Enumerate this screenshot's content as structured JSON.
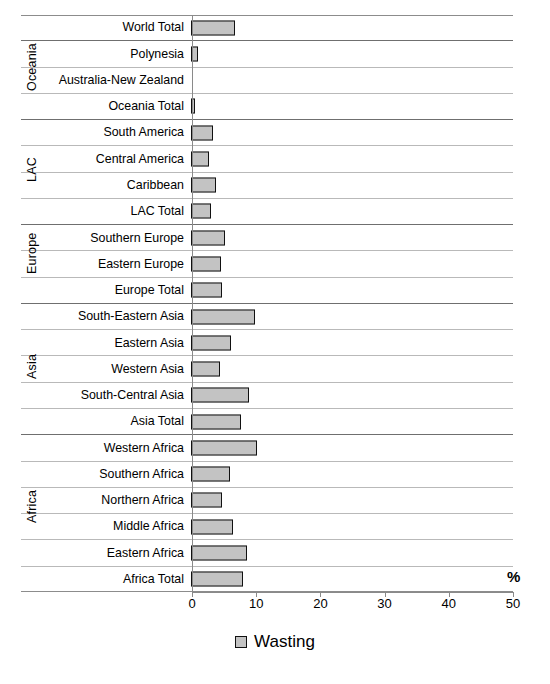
{
  "chart_data": {
    "type": "bar",
    "orientation": "horizontal",
    "title": "",
    "xlabel": "%",
    "ylabel": "",
    "xlim": [
      0,
      50
    ],
    "xticks": [
      0,
      10,
      20,
      30,
      40,
      50
    ],
    "xtick_labels": [
      "0",
      "10",
      "20",
      "30",
      "40",
      "50"
    ],
    "grid": true,
    "legend_position": "bottom-center",
    "legend": [
      "Wasting"
    ],
    "series": [
      {
        "name": "Wasting",
        "color": "#c3c3c3",
        "border_color": "#111111",
        "categories": [
          "World Total",
          "Polynesia",
          "Australia-New Zealand",
          "Oceania Total",
          "South America",
          "Central America",
          "Caribbean",
          "LAC Total",
          "Southern Europe",
          "Eastern Europe",
          "Europe Total",
          "South-Eastern Asia",
          "Eastern Asia",
          "Western Asia",
          "South-Central Asia",
          "Asia Total",
          "Western Africa",
          "Southern Africa",
          "Northern Africa",
          "Middle Africa",
          "Eastern Africa",
          "Africa Total"
        ],
        "values": [
          6.9,
          1.1,
          0.0,
          0.6,
          3.4,
          2.8,
          3.9,
          3.1,
          5.3,
          4.7,
          4.8,
          10.0,
          6.2,
          4.5,
          9.1,
          7.8,
          10.3,
          6.1,
          4.8,
          6.5,
          8.7,
          8.1
        ]
      }
    ],
    "groups": [
      {
        "label": "",
        "rows": 1
      },
      {
        "label": "Oceania",
        "rows": 3
      },
      {
        "label": "LAC",
        "rows": 4
      },
      {
        "label": "Europe",
        "rows": 3
      },
      {
        "label": "Asia",
        "rows": 5
      },
      {
        "label": "Africa",
        "rows": 6
      }
    ]
  },
  "axis": {
    "percent_symbol": "%"
  },
  "legend": {
    "entries": [
      {
        "label": "Wasting",
        "color": "#c3c3c3"
      }
    ]
  }
}
